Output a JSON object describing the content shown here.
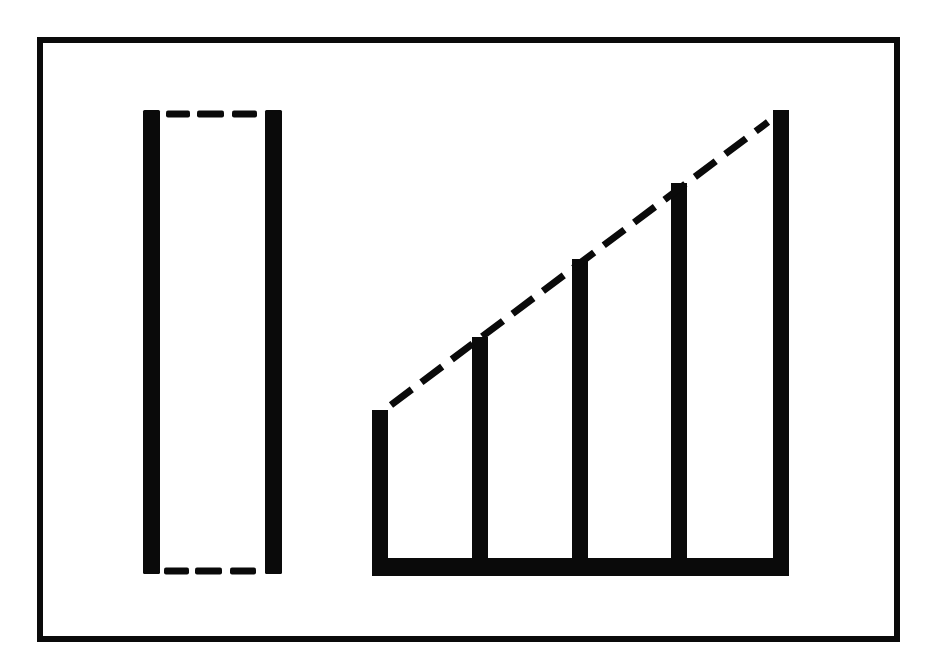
{
  "diagram": {
    "colors": {
      "ink": "#0a0a0a",
      "background": "#ffffff"
    },
    "frame": {
      "x": 37,
      "y": 37,
      "width": 863,
      "height": 605,
      "stroke_width": 6
    },
    "left_figure": {
      "type": "rectangle-with-dashed-ends",
      "left_bar": {
        "x": 143,
        "y": 110,
        "width": 17,
        "height": 464
      },
      "right_bar": {
        "x": 265,
        "y": 110,
        "width": 17,
        "height": 464
      },
      "top_dashes": [
        {
          "x1": 166,
          "x2": 190,
          "y": 114
        },
        {
          "x1": 197,
          "x2": 224,
          "y": 114
        },
        {
          "x1": 232,
          "x2": 257,
          "y": 114
        }
      ],
      "bottom_dashes": [
        {
          "x1": 164,
          "x2": 189,
          "y": 571
        },
        {
          "x1": 195,
          "x2": 222,
          "y": 571
        },
        {
          "x1": 230,
          "x2": 256,
          "y": 571
        }
      ]
    },
    "right_figure": {
      "type": "ascending-bars",
      "bar_width": 16,
      "base": {
        "x": 372,
        "y": 558,
        "width": 417,
        "height": 18
      },
      "bars": [
        {
          "x": 372,
          "top": 410
        },
        {
          "x": 472,
          "top": 337
        },
        {
          "x": 572,
          "top": 259
        },
        {
          "x": 671,
          "top": 183
        },
        {
          "x": 773,
          "top": 110
        }
      ],
      "diagonal": {
        "x1": 391,
        "y1": 405,
        "x2": 768,
        "y2": 122,
        "dash": "26 12",
        "stroke_width": 7
      }
    }
  }
}
